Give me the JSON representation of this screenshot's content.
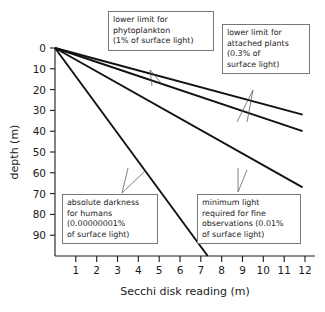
{
  "chart_data": {
    "type": "line",
    "title": "",
    "xlabel": "Secchi disk reading (m)",
    "ylabel": "depth (m)",
    "xlim": [
      0,
      12.6
    ],
    "ylim": [
      0,
      100
    ],
    "y_inverted": true,
    "grid": false,
    "legend": "none",
    "xticks": [
      1,
      2,
      3,
      4,
      5,
      6,
      7,
      8,
      9,
      10,
      11,
      12
    ],
    "yticks": [
      0,
      10,
      20,
      30,
      40,
      50,
      60,
      70,
      80,
      90
    ],
    "series": [
      {
        "name": "lower limit for phytoplankton",
        "percent_surface_light": "1%",
        "x": [
          0,
          12
        ],
        "values": [
          0,
          32
        ]
      },
      {
        "name": "lower limit for attached plants",
        "percent_surface_light": "0.3%",
        "x": [
          0,
          12
        ],
        "values": [
          0,
          40
        ]
      },
      {
        "name": "minimum light required for fine observations",
        "percent_surface_light": "0.01%",
        "x": [
          0,
          12
        ],
        "values": [
          0,
          67
        ]
      },
      {
        "name": "absolute darkness for humans",
        "percent_surface_light": "0.00000001%",
        "x": [
          0,
          7.4
        ],
        "values": [
          0,
          100
        ]
      }
    ],
    "annotations": [
      {
        "id": "phytoplankton",
        "lines": [
          "lower limit for",
          "phytoplankton",
          "(1% of surface light)"
        ],
        "points_to_series": 0
      },
      {
        "id": "attached-plants",
        "lines": [
          "lower limit for",
          "attached plants",
          "(0.3% of",
          "surface light)"
        ],
        "points_to_series": 1
      },
      {
        "id": "absolute-darkness",
        "lines": [
          "absolute darkness",
          "for humans",
          "(0.00000001%",
          "of surface light)"
        ],
        "points_to_series": 3
      },
      {
        "id": "fine-observations",
        "lines": [
          "minimum light",
          "required for fine",
          "observations (0.01%",
          "of surface light)"
        ],
        "points_to_series": 2
      }
    ]
  },
  "axes": {
    "y_label": "depth (m)",
    "x_label": "Secchi disk reading (m)",
    "y_tick_labels": [
      "0",
      "10",
      "20",
      "30",
      "40",
      "50",
      "60",
      "70",
      "80",
      "90"
    ],
    "x_tick_labels": [
      "1",
      "2",
      "3",
      "4",
      "5",
      "6",
      "7",
      "8",
      "9",
      "10",
      "11",
      "12"
    ]
  }
}
